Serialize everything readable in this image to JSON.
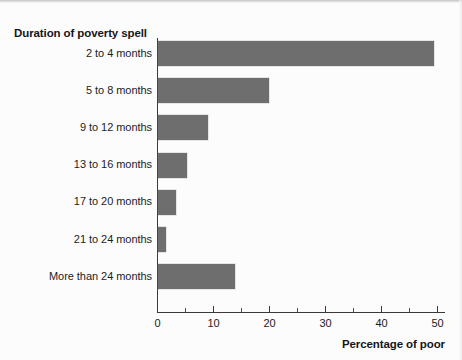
{
  "chart_data": {
    "type": "bar",
    "orientation": "horizontal",
    "title": "",
    "categories": [
      "2 to 4 months",
      "5 to 8 months",
      "9 to 12 months",
      "13 to 16 months",
      "17 to 20 months",
      "21 to 24 months",
      "More than 24 months"
    ],
    "values": [
      49.3,
      19.8,
      8.9,
      5.2,
      3.2,
      1.4,
      13.7
    ],
    "xlabel": "Percentage of poor",
    "ylabel": "Duration of poverty spell",
    "xlim": [
      0,
      51.5
    ],
    "xticks": [
      0,
      10,
      20,
      30,
      40,
      50
    ],
    "xtick_labels": [
      "0",
      "10",
      "20",
      "30",
      "40",
      "50"
    ],
    "x_minor_ticks": [
      5,
      15,
      25,
      35,
      45
    ],
    "grid": false,
    "legend": false,
    "bar_color": "#6e6e6e",
    "axis_color": "#3a3a3a",
    "background_color": "#fcfcfc",
    "text_color": "#1b1b1f"
  }
}
